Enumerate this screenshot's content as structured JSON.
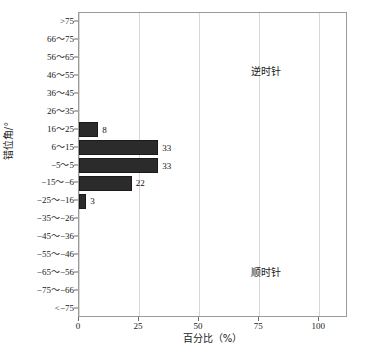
{
  "chart_data": {
    "type": "bar",
    "orientation": "horizontal",
    "title": "",
    "xlabel": "百分比（%）",
    "ylabel": "错位角/°",
    "xlim": [
      0,
      112
    ],
    "xticks": [
      0,
      25,
      50,
      75,
      100
    ],
    "xticklabels": [
      "0",
      "25",
      "50",
      "75",
      "100"
    ],
    "grid": "vertical",
    "legend": "none",
    "categories": [
      ">75",
      "66~75",
      "56~65",
      "46~55",
      "36~45",
      "26~35",
      "16~25",
      "6~15",
      "-5~5",
      "-15~-6",
      "-25~-16",
      "-35~-26",
      "-45~-36",
      "-55~-46",
      "-65~-56",
      "-75~-66",
      "<-75"
    ],
    "values": [
      0,
      0,
      0,
      0,
      0,
      0,
      8,
      33,
      33,
      22,
      3,
      0,
      0,
      0,
      0,
      0,
      0
    ],
    "bar_labels": [
      "",
      "",
      "",
      "",
      "",
      "",
      "8",
      "33",
      "33",
      "22",
      "3",
      "",
      "",
      "",
      "",
      "",
      ""
    ],
    "bar_color": "#2b2b2b",
    "annotations": [
      {
        "text": "逆时针",
        "x": 60,
        "y": "26~35"
      },
      {
        "text": "顺时针",
        "x": 60,
        "y": "-55~-46"
      }
    ]
  },
  "axes": {
    "y_title": "错位角/°",
    "x_title": "百分比（%）"
  },
  "annotations": {
    "counterclockwise": "逆时针",
    "clockwise": "顺时针"
  }
}
